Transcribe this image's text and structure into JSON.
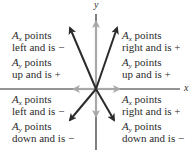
{
  "diagram": {
    "axes": {
      "x_label": "x",
      "y_label": "y"
    },
    "quadrants": {
      "upper_left": {
        "line1_sym": "A",
        "line1_sub": "x",
        "line1_rest": " points",
        "line2": "left and is −",
        "line3_sym": "A",
        "line3_sub": "y",
        "line3_rest": " points",
        "line4": "up and is +"
      },
      "upper_right": {
        "line1_sym": "A",
        "line1_sub": "x",
        "line1_rest": " points",
        "line2": "right and is +",
        "line3_sym": "A",
        "line3_sub": "y",
        "line3_rest": " points",
        "line4": "up and is +"
      },
      "lower_left": {
        "line1_sym": "A",
        "line1_sub": "x",
        "line1_rest": " points",
        "line2": "left and is −",
        "line3_sym": "A",
        "line3_sub": "y",
        "line3_rest": " points",
        "line4": "down and is −"
      },
      "lower_right": {
        "line1_sym": "A",
        "line1_sub": "x",
        "line1_rest": " points",
        "line2": "right and is +",
        "line3_sym": "A",
        "line3_sub": "y",
        "line3_rest": " points",
        "line4": "down and is −"
      }
    },
    "colors": {
      "vector": "#2b2b2b",
      "component": "#a8a8a8",
      "axis": "#2b2b2b"
    }
  }
}
